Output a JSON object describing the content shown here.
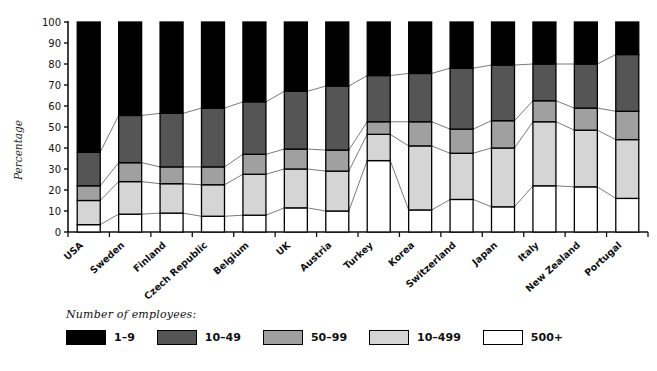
{
  "chart_data": {
    "type": "bar",
    "stacked": true,
    "stacked_mode": "percent",
    "title": "",
    "xlabel": "",
    "ylabel": "Percentage",
    "ylim": [
      0,
      100
    ],
    "ytick_step": 10,
    "yticks": [
      0,
      10,
      20,
      30,
      40,
      50,
      60,
      70,
      80,
      90,
      100
    ],
    "ytick_labels": [
      "0",
      "10",
      "20",
      "30",
      "40",
      "50",
      "60",
      "70",
      "80",
      "90",
      "100"
    ],
    "grid": false,
    "legend_position": "below",
    "legend_title": "Number of employees:",
    "connector_lines": true,
    "categories": [
      "USA",
      "Sweden",
      "Finland",
      "Czech Republic",
      "Belgium",
      "UK",
      "Austria",
      "Turkey",
      "Korea",
      "Switzerland",
      "Japan",
      "Italy",
      "New Zealand",
      "Portugal"
    ],
    "series": [
      {
        "name": "500+",
        "color": "#ffffff",
        "values": [
          3.5,
          8.5,
          9.0,
          7.5,
          8.0,
          11.5,
          10.0,
          34.0,
          10.5,
          15.5,
          12.0,
          22.0,
          21.5,
          16.0
        ]
      },
      {
        "name": "10–499",
        "color": "#d5d5d5",
        "values": [
          11.5,
          15.5,
          14.0,
          15.0,
          19.5,
          18.5,
          19.0,
          12.5,
          30.5,
          22.0,
          28.0,
          30.5,
          27.0,
          28.0
        ]
      },
      {
        "name": "50–99",
        "color": "#a0a0a0",
        "values": [
          7.0,
          9.0,
          8.0,
          8.5,
          9.5,
          9.5,
          10.0,
          6.0,
          11.5,
          11.5,
          13.0,
          10.0,
          10.5,
          13.5
        ]
      },
      {
        "name": "10–49",
        "color": "#555555",
        "values": [
          16.0,
          22.5,
          25.5,
          28.0,
          25.0,
          27.5,
          30.5,
          22.0,
          23.0,
          29.0,
          26.5,
          17.5,
          21.0,
          27.0
        ]
      },
      {
        "name": "1–9",
        "color": "#000000",
        "values": [
          62.0,
          44.5,
          43.5,
          41.0,
          38.0,
          33.0,
          30.5,
          25.5,
          24.5,
          22.0,
          20.5,
          20.0,
          20.0,
          15.5
        ]
      }
    ],
    "cumulative_tops": {
      "500+": [
        3.5,
        8.5,
        9.0,
        7.5,
        8.0,
        11.5,
        10.0,
        34.0,
        10.5,
        15.5,
        12.0,
        22.0,
        21.5,
        16.0
      ],
      "10-499": [
        15.0,
        24.0,
        23.0,
        22.5,
        27.5,
        30.0,
        29.0,
        46.5,
        41.0,
        37.5,
        40.0,
        52.5,
        48.5,
        44.0
      ],
      "50-99": [
        22.0,
        33.0,
        31.0,
        31.0,
        37.0,
        39.5,
        39.0,
        52.5,
        52.5,
        49.0,
        53.0,
        62.5,
        59.0,
        57.5
      ],
      "10-49": [
        38.0,
        55.5,
        56.5,
        59.0,
        62.0,
        67.0,
        69.5,
        74.5,
        75.5,
        78.0,
        79.5,
        80.0,
        80.0,
        84.5
      ],
      "1-9": [
        100,
        100,
        100,
        100,
        100,
        100,
        100,
        100,
        100,
        100,
        100,
        100,
        100,
        100
      ]
    }
  },
  "legend": {
    "title": "Number of employees:",
    "items": [
      {
        "label": "1–9",
        "color": "#000000"
      },
      {
        "label": "10–49",
        "color": "#555555"
      },
      {
        "label": "50–99",
        "color": "#a0a0a0"
      },
      {
        "label": "10–499",
        "color": "#d5d5d5"
      },
      {
        "label": "500+",
        "color": "#ffffff"
      }
    ]
  },
  "axis": {
    "y_title": "Percentage"
  }
}
